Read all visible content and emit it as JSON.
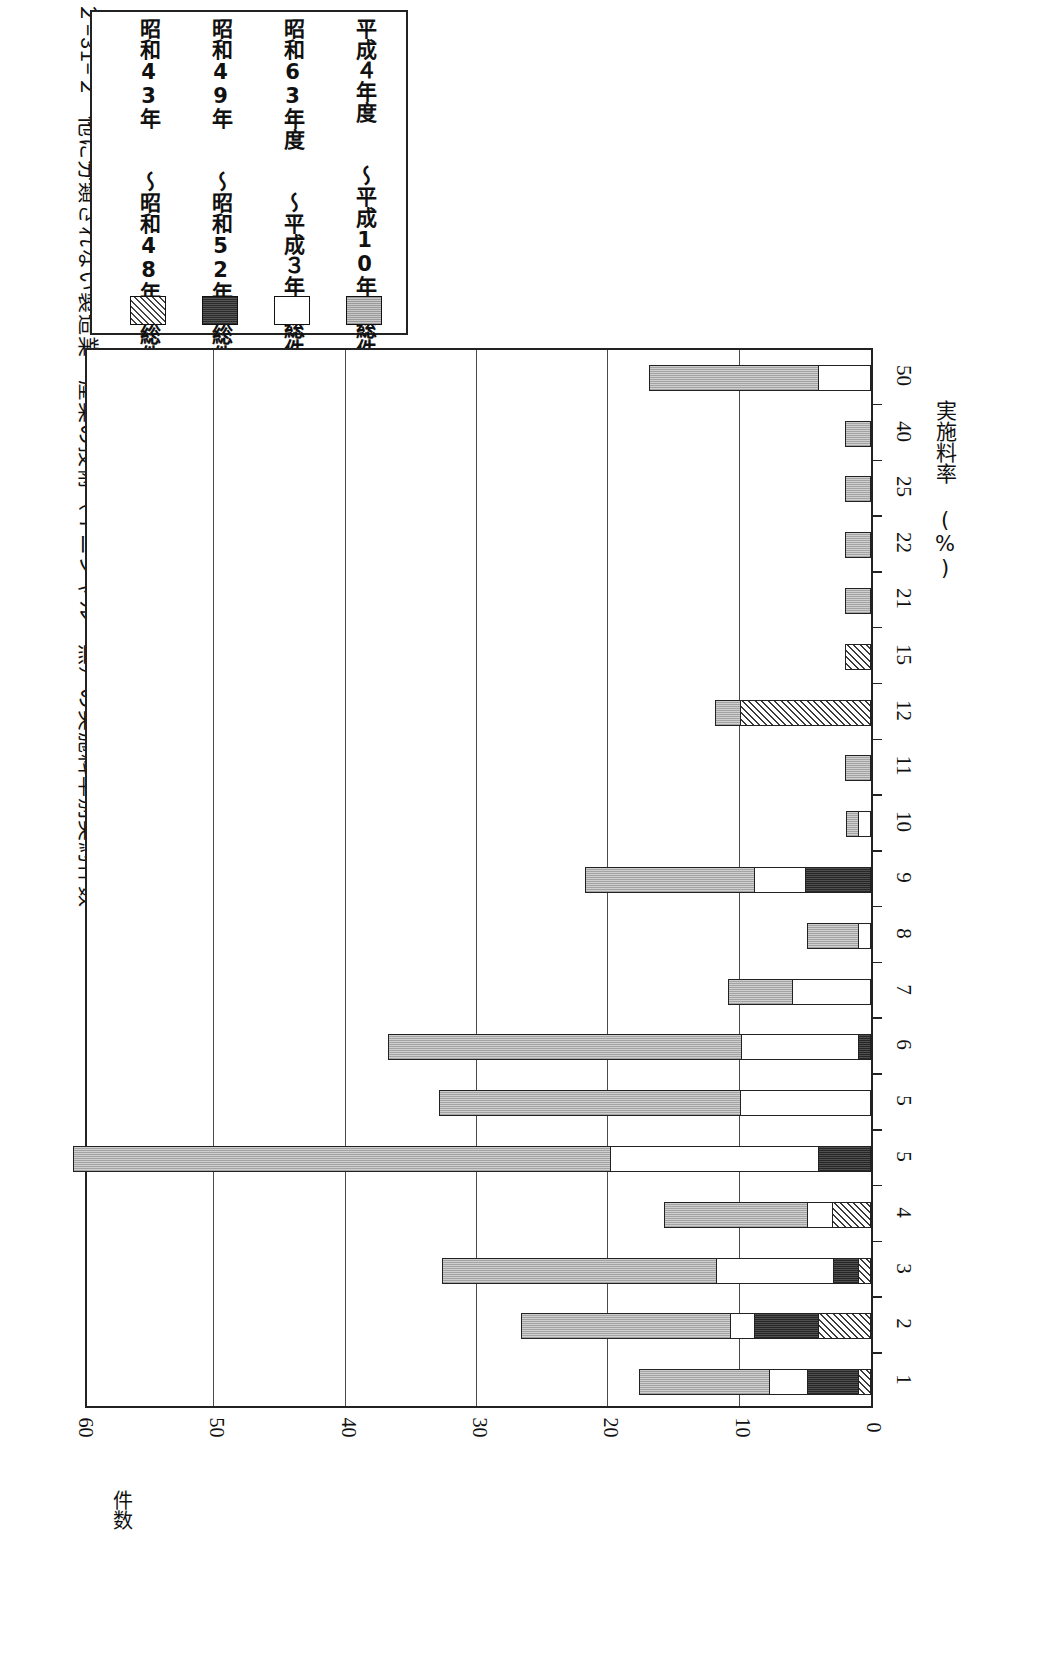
{
  "title": {
    "number": "図２−31−２",
    "text": "他に分類されない製造業・産業の技術（イニシャル　無）の実施料率別契約件数"
  },
  "legend": {
    "items": [
      {
        "key": "heisei4_10",
        "label": "平成４年度　　〜平成10年度総件数累計",
        "swatch": "sw-gray",
        "pattern": "light-gray-dotted"
      },
      {
        "key": "showa63_h3",
        "label": "昭和63年度　　〜平成３年度総件数累計",
        "swatch": "sw-white",
        "pattern": "white"
      },
      {
        "key": "showa49_52",
        "label": "昭和49年　　〜昭和52年　総件数累計",
        "swatch": "sw-dark",
        "pattern": "dark"
      },
      {
        "key": "showa43_48",
        "label": "昭和43年　　〜昭和48年　総件数累計",
        "swatch": "sw-hatch",
        "pattern": "diagonal-hatch"
      }
    ]
  },
  "axes": {
    "value_axis_name": "件数",
    "value_ticks": [
      "60",
      "50",
      "40",
      "30",
      "20",
      "10",
      "0"
    ],
    "category_axis_name": "実施料率 (%)"
  },
  "chart_data": {
    "type": "bar",
    "orientation": "horizontal-rotated",
    "title": "他に分類されない製造業・産業の技術（イニシャル　無）の実施料率別契約件数",
    "xlabel": "実施料率 (%)",
    "ylabel": "件数",
    "ylim": [
      0,
      60
    ],
    "yticks": [
      0,
      10,
      20,
      30,
      40,
      50,
      60
    ],
    "grid": true,
    "legend_position": "top-left",
    "categories": [
      "50",
      "40",
      "25",
      "22",
      "21",
      "15",
      "12",
      "11",
      "10",
      "9",
      "8",
      "7",
      "6",
      "5",
      "5",
      "4",
      "3",
      "2",
      "1"
    ],
    "series": [
      {
        "name": "平成４年度　〜平成10年度総件数累計",
        "pattern": "light-gray-dotted",
        "values": [
          13,
          2,
          2,
          2,
          2,
          0,
          2,
          2,
          1,
          13,
          4,
          5,
          27,
          23,
          41,
          11,
          21,
          16,
          10
        ]
      },
      {
        "name": "昭和63年度　〜平成３年度総件数累計",
        "pattern": "white",
        "values": [
          4,
          0,
          0,
          0,
          0,
          0,
          0,
          0,
          1,
          4,
          1,
          6,
          9,
          10,
          16,
          2,
          9,
          2,
          3
        ]
      },
      {
        "name": "昭和49年　〜昭和52年　総件数累計",
        "pattern": "dark",
        "values": [
          0,
          0,
          0,
          0,
          0,
          0,
          0,
          0,
          0,
          5,
          0,
          0,
          1,
          0,
          4,
          0,
          2,
          5,
          4
        ]
      },
      {
        "name": "昭和43年　〜昭和48年　総件数累計",
        "pattern": "diagonal-hatch",
        "values": [
          0,
          0,
          0,
          0,
          0,
          2,
          10,
          0,
          0,
          0,
          0,
          0,
          0,
          0,
          0,
          3,
          1,
          4,
          1
        ]
      }
    ],
    "totals": [
      17,
      2,
      2,
      2,
      2,
      2,
      12,
      2,
      2,
      22,
      5,
      11,
      37,
      33,
      61,
      16,
      33,
      27,
      18
    ]
  }
}
